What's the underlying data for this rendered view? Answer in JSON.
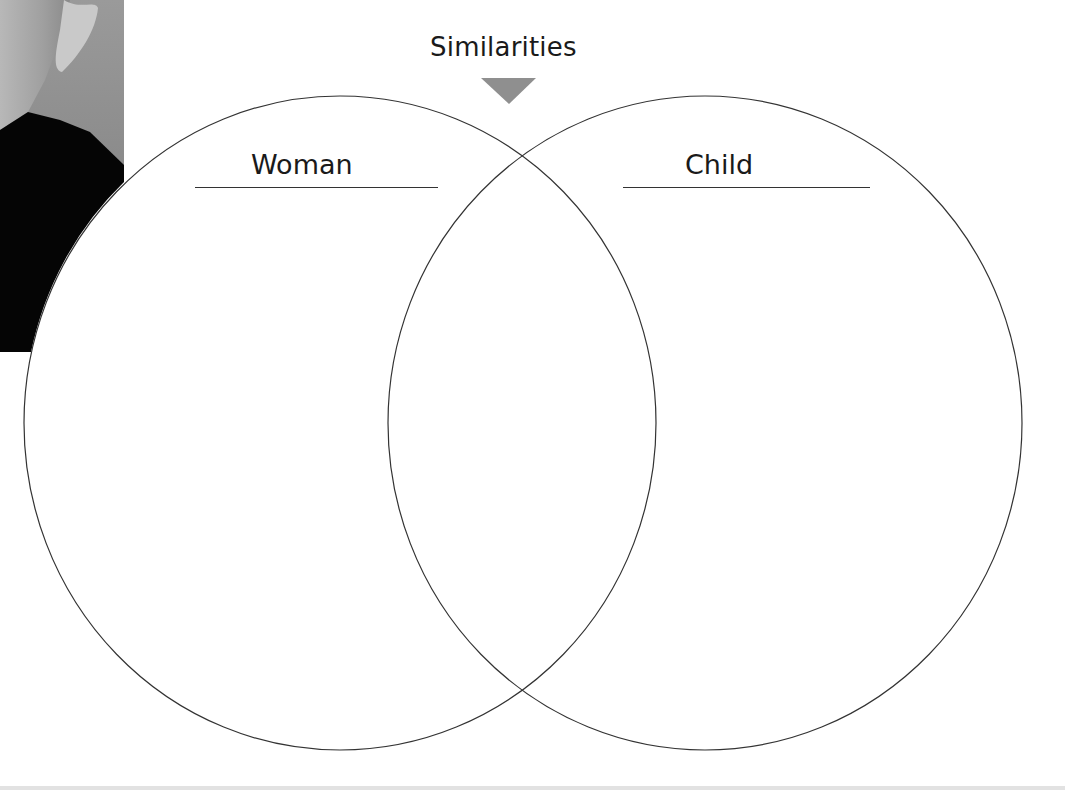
{
  "diagram": {
    "type": "venn",
    "title": "Similarities",
    "left_set": {
      "label": "Woman"
    },
    "right_set": {
      "label": "Child"
    },
    "pointer": {
      "shape": "downward-triangle",
      "color": "#8f8f8f"
    },
    "stroke_color": "#333333",
    "photo": {
      "description": "grayscale photo fragment of a person's ear, neck and dark sweater"
    }
  }
}
